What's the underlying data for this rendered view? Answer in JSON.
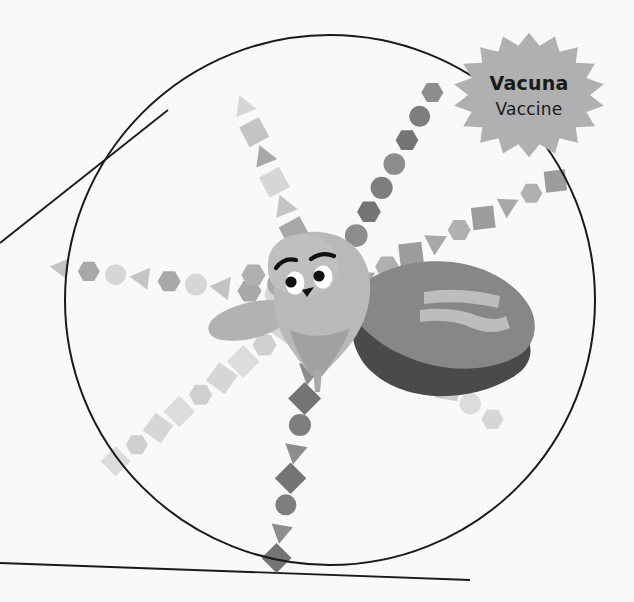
{
  "canvas": {
    "width": 634,
    "height": 602,
    "background_color": "#f9f9f9",
    "title": "Vaccine superhero illustration under magnifying glass"
  },
  "palette": {
    "background": "#f9f9f9",
    "outline": "#1a1a1a",
    "body_light": "#b9b9b9",
    "body_mid": "#a3a3a3",
    "body_shade": "#989898",
    "cape_mid": "#878787",
    "cape_shadow": "#4a4a4a",
    "cape_stripe": "#bdbdbd",
    "ray_light": "#d6d6d6",
    "ray_mid": "#a8a8a8",
    "ray_dark": "#7e7e7e",
    "badge_fill": "#b0b0b0",
    "badge_text": "#1a1a1a",
    "eye_white": "#ffffff",
    "eye_pupil": "#111111"
  },
  "magnifier": {
    "name": "magnifying-glass-lens",
    "center_x": 330,
    "center_y": 300,
    "radius": 265,
    "stroke_color": "#1a1a1a",
    "stroke_width": 2,
    "fill": "none",
    "handle_lines": [
      {
        "name": "handle-upper",
        "x1": 0,
        "y1": 243,
        "x2": 168,
        "y2": 110
      },
      {
        "name": "handle-lower",
        "x1": 0,
        "y1": 563,
        "x2": 470,
        "y2": 580
      }
    ]
  },
  "badge": {
    "name": "vaccine-starburst-badge",
    "shape": "starburst",
    "center_x": 529,
    "center_y": 95,
    "radius_outer": 76,
    "radius_inner": 61,
    "points": 18,
    "fill": "#b0b0b0",
    "title": "Vacuna",
    "subtitle": "Vaccine"
  },
  "character": {
    "name": "vaccine-superhero",
    "description": "Cartoon vaccine vial character with cape flying forward",
    "face": {
      "eyes": [
        {
          "name": "left-eye",
          "cx": 295,
          "cy": 283,
          "rx": 9,
          "ry": 11
        },
        {
          "name": "right-eye",
          "cx": 323,
          "cy": 277,
          "rx": 9,
          "ry": 11
        }
      ],
      "pupils": [
        {
          "name": "left-pupil",
          "cx": 291,
          "cy": 283,
          "r": 5.5
        },
        {
          "name": "right-pupil",
          "cx": 319,
          "cy": 276,
          "r": 5.5
        }
      ],
      "eyebrows": [
        {
          "name": "left-eyebrow",
          "path": "M 278 266 Q 285 258 294 261"
        },
        {
          "name": "right-eyebrow",
          "path": "M 313 258 Q 323 252 333 256"
        }
      ],
      "mouth": {
        "name": "smile",
        "path": "M 303 291 Q 309 297 313 289 Z"
      }
    },
    "cape": {
      "name": "hero-cape",
      "fill": "#878787",
      "shadow_fill": "#4a4a4a",
      "stripes": 2
    }
  },
  "rays": [
    {
      "name": "ray-north",
      "direction": "up",
      "angle_deg": -112,
      "shape_sequence": [
        "triangle",
        "square",
        "triangle",
        "square",
        "triangle",
        "square",
        "triangle"
      ],
      "tone": "light-mid"
    },
    {
      "name": "ray-northeast",
      "direction": "up-right",
      "angle_deg": -62,
      "shape_sequence": [
        "circle",
        "circle",
        "hexagon",
        "circle",
        "circle",
        "hexagon",
        "circle",
        "hexagon"
      ],
      "tone": "dark"
    },
    {
      "name": "ray-east-upper",
      "direction": "right-up",
      "angle_deg": -27,
      "shape_sequence": [
        "triangle",
        "hexagon",
        "square",
        "triangle",
        "hexagon",
        "square",
        "triangle",
        "hexagon",
        "square"
      ],
      "tone": "mid"
    },
    {
      "name": "ray-southeast",
      "direction": "right-down",
      "angle_deg": 35,
      "shape_sequence": [
        "circle",
        "hexagon",
        "circle",
        "hexagon",
        "square",
        "circle",
        "hexagon"
      ],
      "tone": "light"
    },
    {
      "name": "ray-south",
      "direction": "down",
      "angle_deg": 100,
      "shape_sequence": [
        "circle",
        "triangle",
        "diamond",
        "circle",
        "triangle",
        "diamond",
        "circle",
        "triangle",
        "diamond"
      ],
      "tone": "dark"
    },
    {
      "name": "ray-southwest",
      "direction": "down-left",
      "angle_deg": 142,
      "shape_sequence": [
        "square",
        "hexagon",
        "diamond",
        "square",
        "hexagon",
        "diamond",
        "square",
        "hexagon",
        "diamond"
      ],
      "tone": "light"
    },
    {
      "name": "ray-west",
      "direction": "left",
      "angle_deg": 187,
      "shape_sequence": [
        "circle",
        "hexagon",
        "triangle",
        "circle",
        "hexagon",
        "triangle",
        "circle",
        "hexagon",
        "triangle"
      ],
      "tone": "light-mid"
    },
    {
      "name": "ray-northwest",
      "direction": "left-up",
      "angle_deg": 200,
      "shape_sequence": [
        "circle",
        "hexagon"
      ],
      "tone": "mid"
    }
  ]
}
